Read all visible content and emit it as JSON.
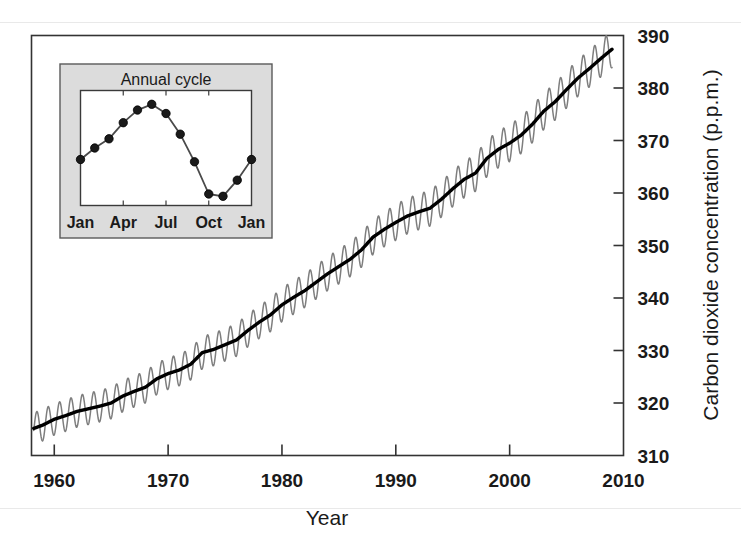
{
  "chart_data": {
    "type": "line",
    "title": "",
    "xlabel": "Year",
    "ylabel": "Carbon dioxide concentration (p.p.m.)",
    "xlim": [
      1958,
      2010
    ],
    "ylim": [
      310,
      390
    ],
    "xticks": [
      1960,
      1970,
      1980,
      1990,
      2000,
      2010
    ],
    "yticks": [
      310,
      320,
      330,
      340,
      350,
      360,
      370,
      380,
      390
    ],
    "grid": false,
    "legend": "none",
    "series": [
      {
        "name": "Monthly mean CO2 (seasonal oscillation)",
        "color": "#7a7a7a",
        "note": "monthly record with ~6 p.p.m. peak-to-peak annual cycle superimposed on the trend",
        "x": [
          1958.0,
          1959.0,
          1960.0,
          1961.0,
          1962.0,
          1963.0,
          1964.0,
          1965.0,
          1966.0,
          1967.0,
          1968.0,
          1969.0,
          1970.0,
          1971.0,
          1972.0,
          1973.0,
          1974.0,
          1975.0,
          1976.0,
          1977.0,
          1978.0,
          1979.0,
          1980.0,
          1981.0,
          1982.0,
          1983.0,
          1984.0,
          1985.0,
          1986.0,
          1987.0,
          1988.0,
          1989.0,
          1990.0,
          1991.0,
          1992.0,
          1993.0,
          1994.0,
          1995.0,
          1996.0,
          1997.0,
          1998.0,
          1999.0,
          2000.0,
          2001.0,
          2002.0,
          2003.0,
          2004.0,
          2005.0,
          2006.0,
          2007.0,
          2008.0,
          2009.0
        ],
        "amplitude": [
          3.0,
          3.0,
          3.0,
          3.0,
          3.0,
          3.0,
          3.0,
          3.0,
          3.0,
          3.0,
          3.0,
          3.0,
          3.0,
          3.0,
          3.0,
          3.1,
          3.1,
          3.1,
          3.1,
          3.1,
          3.1,
          3.2,
          3.2,
          3.2,
          3.2,
          3.2,
          3.2,
          3.3,
          3.3,
          3.3,
          3.3,
          3.3,
          3.4,
          3.4,
          3.4,
          3.4,
          3.4,
          3.4,
          3.5,
          3.5,
          3.5,
          3.5,
          3.5,
          3.5,
          3.5,
          3.5,
          3.5,
          3.5,
          3.5,
          3.5,
          3.5,
          3.5
        ]
      },
      {
        "name": "Smoothed trend",
        "color": "#000000",
        "x": [
          1958,
          1959,
          1960,
          1961,
          1962,
          1963,
          1964,
          1965,
          1966,
          1967,
          1968,
          1969,
          1970,
          1971,
          1972,
          1973,
          1974,
          1975,
          1976,
          1977,
          1978,
          1979,
          1980,
          1981,
          1982,
          1983,
          1984,
          1985,
          1986,
          1987,
          1988,
          1989,
          1990,
          1991,
          1992,
          1993,
          1994,
          1995,
          1996,
          1997,
          1998,
          1999,
          2000,
          2001,
          2002,
          2003,
          2004,
          2005,
          2006,
          2007,
          2008,
          2009
        ],
        "y": [
          315.0,
          315.8,
          316.9,
          317.6,
          318.4,
          318.9,
          319.4,
          320.0,
          321.3,
          322.2,
          323.0,
          324.6,
          325.6,
          326.3,
          327.4,
          329.6,
          330.2,
          331.1,
          332.0,
          333.8,
          335.4,
          336.8,
          338.7,
          340.1,
          341.4,
          343.0,
          344.6,
          346.0,
          347.4,
          349.2,
          351.6,
          353.1,
          354.4,
          355.6,
          356.4,
          357.1,
          358.8,
          360.8,
          362.6,
          363.8,
          366.6,
          368.3,
          369.5,
          371.0,
          373.1,
          375.6,
          377.4,
          379.7,
          381.9,
          383.7,
          385.6,
          387.4
        ]
      }
    ]
  },
  "axes": {
    "x": {
      "title": "Year",
      "ticks": [
        "1960",
        "1970",
        "1980",
        "1990",
        "2000",
        "2010"
      ]
    },
    "y": {
      "title": "Carbon dioxide concentration (p.p.m.)",
      "ticks": [
        "310",
        "320",
        "330",
        "340",
        "350",
        "360",
        "370",
        "380",
        "390"
      ]
    }
  },
  "inset": {
    "title": "Annual cycle",
    "background_color": "#dcdcdc",
    "xticks": [
      "Jan",
      "Apr",
      "Jul",
      "Oct",
      "Jan"
    ],
    "chart_data": {
      "type": "line",
      "title": "Annual cycle",
      "xlabel": "",
      "ylabel": "",
      "categories": [
        "Jan",
        "Feb",
        "Mar",
        "Apr",
        "May",
        "Jun",
        "Jul",
        "Aug",
        "Sep",
        "Oct",
        "Nov",
        "Dec",
        "Jan"
      ],
      "values": [
        0.4,
        0.5,
        0.58,
        0.72,
        0.83,
        0.88,
        0.8,
        0.62,
        0.38,
        0.1,
        0.08,
        0.22,
        0.4
      ],
      "marker": "filled-circle",
      "marker_color": "#1a1a1a",
      "line_color": "#4a4a4a",
      "grid": false
    }
  }
}
